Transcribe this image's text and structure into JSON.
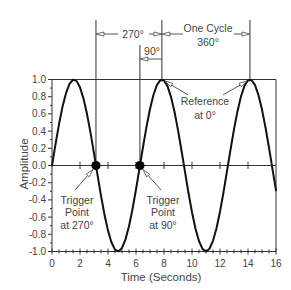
{
  "chart_data": {
    "type": "line",
    "title": "",
    "xlabel": "Time (Seconds)",
    "ylabel": "Amplitude",
    "xlim": [
      0,
      16
    ],
    "ylim": [
      -1.0,
      1.0
    ],
    "grid": false,
    "legend": null,
    "xticks": [
      0,
      2,
      4,
      6,
      8,
      10,
      12,
      14,
      16
    ],
    "xtick_labels": [
      "0",
      "2",
      "4",
      "6",
      "8",
      "10",
      "12",
      "14",
      "16"
    ],
    "yticks": [
      1.0,
      0.8,
      0.6,
      0.4,
      0.2,
      0.0,
      -0.2,
      -0.4,
      -0.6,
      -0.8,
      -1.0
    ],
    "ytick_labels": [
      "1.0",
      "0.8",
      "0.6",
      "0.4",
      "0.2",
      "0.0",
      "-0.2",
      "-0.4",
      "-0.6",
      "-0.8",
      "-1.0"
    ],
    "series": [
      {
        "name": "Sine wave",
        "function": "y = sin(t)",
        "x": [
          0,
          0.25,
          0.5,
          0.75,
          1,
          1.25,
          1.5,
          1.75,
          2,
          2.25,
          2.5,
          2.75,
          3,
          3.25,
          3.5,
          3.75,
          4,
          4.25,
          4.5,
          4.75,
          5,
          5.25,
          5.5,
          5.75,
          6,
          6.25,
          6.5,
          6.75,
          7,
          7.25,
          7.5,
          7.75,
          8,
          8.25,
          8.5,
          8.75,
          9,
          9.25,
          9.5,
          9.75,
          10,
          10.25,
          10.5,
          10.75,
          11,
          11.25,
          11.5,
          11.75,
          12,
          12.25,
          12.5,
          12.75,
          13,
          13.25,
          13.5,
          13.75,
          14,
          14.25,
          14.5,
          14.75,
          15,
          15.25,
          15.5,
          15.75,
          16
        ],
        "y": [
          0.0,
          0.247,
          0.479,
          0.682,
          0.841,
          0.949,
          0.997,
          0.984,
          0.909,
          0.778,
          0.598,
          0.382,
          0.141,
          -0.108,
          -0.351,
          -0.572,
          -0.757,
          -0.895,
          -0.978,
          -0.999,
          -0.959,
          -0.859,
          -0.706,
          -0.508,
          -0.279,
          -0.033,
          0.215,
          0.45,
          0.657,
          0.823,
          0.938,
          0.995,
          0.989,
          0.923,
          0.798,
          0.625,
          0.412,
          0.174,
          -0.075,
          -0.32,
          -0.544,
          -0.735,
          -0.88,
          -0.97,
          -1.0,
          -0.968,
          -0.876,
          -0.729,
          -0.537,
          -0.311,
          -0.066,
          0.183,
          0.42,
          0.632,
          0.804,
          0.926,
          0.991,
          0.994,
          0.935,
          0.818,
          0.65,
          0.442,
          0.206,
          -0.042,
          -0.288
        ]
      }
    ],
    "trigger_points": [
      {
        "label": "Trigger Point at 270°",
        "x": 3.14,
        "y": 0.0
      },
      {
        "label": "Trigger Point at 90°",
        "x": 6.28,
        "y": 0.0
      }
    ],
    "reference_points": [
      {
        "label": "Reference at 0°",
        "x": 7.85,
        "y": 1.0
      },
      {
        "label": "Reference at 0°",
        "x": 14.14,
        "y": 1.0
      }
    ],
    "dimension_lines": [
      {
        "label": "270°",
        "from": 3.14,
        "to": 7.85
      },
      {
        "label": "One Cycle 360°",
        "from": 7.85,
        "to": 14.14
      },
      {
        "label": "90°",
        "from": 6.28,
        "to": 7.85
      }
    ]
  },
  "annotations": {
    "dim_270": "270°",
    "one_cycle_line1": "One Cycle",
    "one_cycle_line2": "360°",
    "dim_90": "90°",
    "reference_line1": "Reference",
    "reference_line2": "at 0°",
    "trigger_270": [
      "Trigger",
      "Point",
      "at 270°"
    ],
    "trigger_90": [
      "Trigger",
      "Point",
      "at 90°"
    ]
  }
}
